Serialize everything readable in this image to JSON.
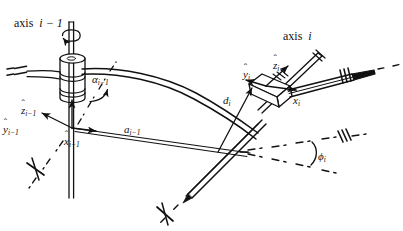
{
  "figure": {
    "type": "kinematic-linkage-denavit-hartenberg-diagram",
    "background_color": "#ffffff",
    "ink_color": "#111111",
    "width": 403,
    "height": 231
  },
  "labels": {
    "axis_prev": {
      "text": "axis i − 1",
      "base": "axis",
      "index": "i − 1",
      "x": 14,
      "y": 18
    },
    "axis_curr": {
      "text": "axis i",
      "base": "axis",
      "index": "i",
      "x": 283,
      "y": 31
    },
    "alpha_prev": {
      "symbol": "α",
      "subscript": "i−1",
      "text": "αi−1",
      "x": 92,
      "y": 74
    },
    "a_prev": {
      "symbol": "a",
      "subscript": "i−1",
      "text": "ai−1",
      "x": 124,
      "y": 124
    },
    "d_curr": {
      "symbol": "d",
      "subscript": "i",
      "text": "di",
      "x": 223,
      "y": 96
    },
    "phi_curr": {
      "symbol": "ϕ",
      "subscript": "i",
      "text": "ϕi",
      "x": 318,
      "y": 152
    },
    "z_prev": {
      "symbol": "z",
      "accent": "ˆ",
      "subscript": "i−1",
      "text": "ẑi−1",
      "x": 21,
      "y": 106
    },
    "y_prev": {
      "symbol": "y",
      "accent": "ˆ",
      "subscript": "i−1",
      "text": "ŷi−1",
      "x": 3,
      "y": 125
    },
    "x_prev": {
      "symbol": "x",
      "accent": "ˆ",
      "subscript": "i−1",
      "text": "x̂i−1",
      "x": 64,
      "y": 137
    },
    "z_curr": {
      "symbol": "z",
      "accent": "ˆ",
      "subscript": "i",
      "text": "ẑi",
      "x": 273,
      "y": 61
    },
    "y_curr": {
      "symbol": "y",
      "accent": "ˆ",
      "subscript": "i",
      "text": "ŷi",
      "x": 245,
      "y": 70
    },
    "x_curr": {
      "symbol": "x",
      "accent": "ˆ",
      "subscript": "i",
      "text": "x̂i",
      "x": 295,
      "y": 96
    }
  },
  "geometry": {
    "joint_prev": {
      "cx": 72,
      "cy": 76,
      "label": "revolute-joint-cylinder-i-minus-1"
    },
    "joint_curr": {
      "cx": 268,
      "cy": 85,
      "label": "revolute-joint-box-i"
    },
    "frame_origin_prev": {
      "x": 72,
      "y": 128
    },
    "frame_origin_curr": {
      "x": 266,
      "y": 86
    },
    "common_normal_prev": {
      "from": [
        72,
        128
      ],
      "to": [
        248,
        153
      ]
    },
    "link_curve": {
      "from": [
        72,
        73
      ],
      "to": [
        258,
        97
      ]
    }
  }
}
